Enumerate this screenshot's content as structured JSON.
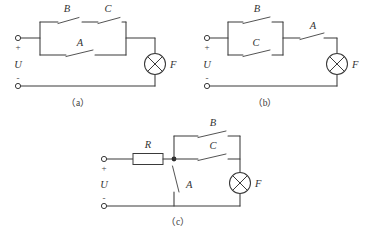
{
  "figure": {
    "background_color": "#ffffff",
    "line_color": "#3a3a3a",
    "width": 371,
    "height": 234
  },
  "circuits": [
    {
      "id": "a",
      "caption": "（a）",
      "source_label": "U",
      "plus_sign": "+",
      "minus_sign": "-",
      "topology": "switches B and C in series on upper branch, parallel with switch A on lower branch, feeding lamp F",
      "components": [
        {
          "name": "switch-b",
          "label": "B",
          "kind": "switch",
          "state": "open"
        },
        {
          "name": "switch-c",
          "label": "C",
          "kind": "switch",
          "state": "open"
        },
        {
          "name": "switch-a",
          "label": "A",
          "kind": "switch",
          "state": "open"
        },
        {
          "name": "lamp-f",
          "label": "F",
          "kind": "lamp"
        }
      ]
    },
    {
      "id": "b",
      "caption": "（b）",
      "source_label": "U",
      "plus_sign": "+",
      "minus_sign": "-",
      "topology": "switches B and C in parallel, in series with switch A, feeding lamp F",
      "components": [
        {
          "name": "switch-b",
          "label": "B",
          "kind": "switch",
          "state": "open"
        },
        {
          "name": "switch-c",
          "label": "C",
          "kind": "switch",
          "state": "open"
        },
        {
          "name": "switch-a",
          "label": "A",
          "kind": "switch",
          "state": "open"
        },
        {
          "name": "lamp-f",
          "label": "F",
          "kind": "lamp"
        }
      ]
    },
    {
      "id": "c",
      "caption": "（c）",
      "source_label": "U",
      "plus_sign": "+",
      "minus_sign": "-",
      "topology": "resistor R in series from positive terminal to a junction; switch A shunts junction to negative rail; switches B and C in parallel connect junction to lamp F",
      "components": [
        {
          "name": "resistor-r",
          "label": "R",
          "kind": "resistor"
        },
        {
          "name": "switch-b",
          "label": "B",
          "kind": "switch",
          "state": "open"
        },
        {
          "name": "switch-c",
          "label": "C",
          "kind": "switch",
          "state": "open"
        },
        {
          "name": "switch-a",
          "label": "A",
          "kind": "switch",
          "state": "open"
        },
        {
          "name": "lamp-f",
          "label": "F",
          "kind": "lamp"
        },
        {
          "name": "junction",
          "label": "",
          "kind": "junction-dot"
        }
      ]
    }
  ],
  "labels": {
    "a_B": "B",
    "a_C": "C",
    "a_A": "A",
    "a_F": "F",
    "a_U": "U",
    "a_plus": "+",
    "a_minus": "-",
    "a_caption": "（a）",
    "b_B": "B",
    "b_C": "C",
    "b_A": "A",
    "b_F": "F",
    "b_U": "U",
    "b_plus": "+",
    "b_minus": "-",
    "b_caption": "（b）",
    "c_R": "R",
    "c_B": "B",
    "c_C": "C",
    "c_A": "A",
    "c_F": "F",
    "c_U": "U",
    "c_plus": "+",
    "c_minus": "-",
    "c_caption": "（c）"
  }
}
